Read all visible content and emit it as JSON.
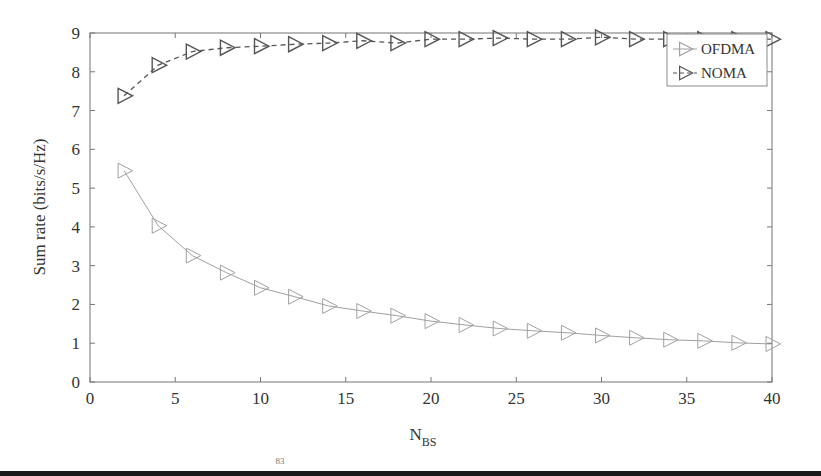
{
  "chart_data": {
    "type": "line",
    "title": "",
    "xlabel": "N",
    "xlabel_subscript": "BS",
    "ylabel": "Sum rate (bits/s/Hz)",
    "xlim": [
      0,
      40
    ],
    "ylim": [
      0,
      9
    ],
    "xticks": [
      0,
      5,
      10,
      15,
      20,
      25,
      30,
      35,
      40
    ],
    "yticks": [
      0,
      1,
      2,
      3,
      4,
      5,
      6,
      7,
      8,
      9
    ],
    "grid": false,
    "legend_position": "upper right",
    "x": [
      2,
      4,
      6,
      8,
      10,
      12,
      14,
      16,
      18,
      20,
      22,
      24,
      26,
      28,
      30,
      32,
      34,
      36,
      38,
      40
    ],
    "series": [
      {
        "name": "OFDMA",
        "marker": "triangle-right",
        "line_style": "solid",
        "color": "#a0a0a0",
        "values": [
          5.45,
          4.03,
          3.26,
          2.82,
          2.43,
          2.2,
          1.96,
          1.83,
          1.71,
          1.57,
          1.47,
          1.38,
          1.32,
          1.27,
          1.2,
          1.14,
          1.09,
          1.06,
          1.01,
          0.98
        ]
      },
      {
        "name": "NOMA",
        "marker": "triangle-right",
        "line_style": "dashed",
        "color": "#555555",
        "values": [
          7.38,
          8.17,
          8.52,
          8.62,
          8.66,
          8.71,
          8.74,
          8.8,
          8.74,
          8.84,
          8.84,
          8.87,
          8.84,
          8.84,
          8.89,
          8.84,
          8.84,
          8.84,
          8.84,
          8.84
        ]
      }
    ]
  },
  "legend": {
    "items": [
      {
        "label": "OFDMA"
      },
      {
        "label": "NOMA"
      }
    ]
  },
  "axes": {
    "x_label_main": "N",
    "x_label_sub": "BS",
    "y_label": "Sum rate (bits/s/Hz)"
  },
  "page_number": "83"
}
